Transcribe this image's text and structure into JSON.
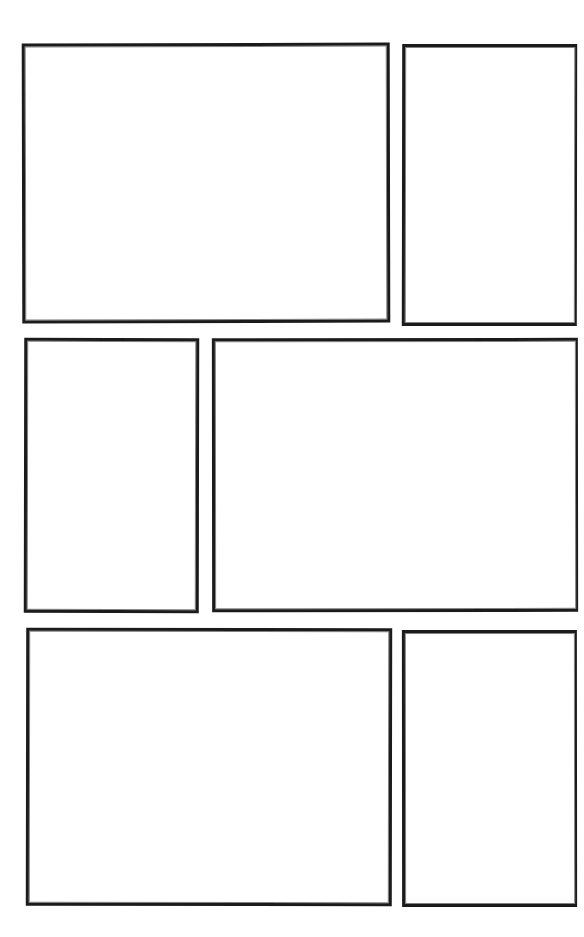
{
  "page": {
    "width": 584,
    "height": 937,
    "background_color": "#ffffff",
    "ink_color": "#1b1b1b",
    "panel_count": 6,
    "row_count": 3,
    "layout_description": "Six empty comic panels arranged in three rows on a white page with white gutters."
  },
  "panels": [
    {
      "id": "panel-1",
      "row": 1,
      "position_in_row": 1,
      "label": "",
      "content": "",
      "shape": "landscape",
      "x": 22,
      "y": 43,
      "width": 368,
      "height": 280
    },
    {
      "id": "panel-2",
      "row": 1,
      "position_in_row": 2,
      "label": "",
      "content": "",
      "shape": "portrait",
      "x": 402,
      "y": 44,
      "width": 175,
      "height": 282
    },
    {
      "id": "panel-3",
      "row": 2,
      "position_in_row": 1,
      "label": "",
      "content": "",
      "shape": "portrait",
      "x": 24,
      "y": 338,
      "width": 175,
      "height": 275
    },
    {
      "id": "panel-4",
      "row": 2,
      "position_in_row": 2,
      "label": "",
      "content": "",
      "shape": "landscape",
      "x": 212,
      "y": 338,
      "width": 366,
      "height": 274
    },
    {
      "id": "panel-5",
      "row": 3,
      "position_in_row": 1,
      "label": "",
      "content": "",
      "shape": "landscape",
      "x": 26,
      "y": 628,
      "width": 366,
      "height": 278
    },
    {
      "id": "panel-6",
      "row": 3,
      "position_in_row": 2,
      "label": "",
      "content": "",
      "shape": "portrait",
      "x": 402,
      "y": 630,
      "width": 175,
      "height": 277
    }
  ]
}
